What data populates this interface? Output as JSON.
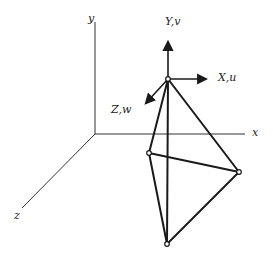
{
  "diagram": {
    "type": "3D coordinate frames with tetrahedron",
    "global_axes": {
      "x_label": "x",
      "y_label": "y",
      "z_label": "z"
    },
    "local_axes": {
      "x_label": "X,u",
      "y_label": "Y,v",
      "z_label": "Z,w"
    },
    "nodes": [
      {
        "id": "top",
        "x": 168,
        "y": 79
      },
      {
        "id": "left",
        "x": 149,
        "y": 153
      },
      {
        "id": "right",
        "x": 239,
        "y": 172
      },
      {
        "id": "bottom",
        "x": 167,
        "y": 244
      }
    ],
    "edges": [
      [
        "top",
        "left"
      ],
      [
        "top",
        "right"
      ],
      [
        "top",
        "bottom"
      ],
      [
        "left",
        "right"
      ],
      [
        "left",
        "bottom"
      ],
      [
        "right",
        "bottom"
      ]
    ],
    "colors": {
      "line": "#1a1a1a",
      "background": "#ffffff"
    }
  }
}
